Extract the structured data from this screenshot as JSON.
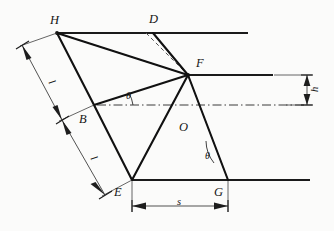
{
  "figure": {
    "type": "geometry-diagram",
    "background_color": "#fbfbfa",
    "line_color": "#1a1a1a",
    "dash_color": "#4d4d4d",
    "dim_color": "#2b2b2b"
  },
  "points": [
    {
      "id": "H",
      "label": "H",
      "x": 57,
      "y": 33,
      "label_x": 50,
      "label_y": 14
    },
    {
      "id": "D",
      "label": "D",
      "x": 153,
      "y": 33,
      "label_x": 149,
      "label_y": 13
    },
    {
      "id": "F",
      "label": "F",
      "x": 188,
      "y": 75,
      "label_x": 196,
      "label_y": 57
    },
    {
      "id": "B",
      "label": "B",
      "x": 94,
      "y": 105,
      "label_x": 79,
      "label_y": 113
    },
    {
      "id": "O",
      "label": "O",
      "x": 176,
      "y": 122,
      "label_x": 179,
      "label_y": 121
    },
    {
      "id": "E",
      "label": "E",
      "x": 132,
      "y": 180,
      "label_x": 114,
      "label_y": 186
    },
    {
      "id": "G",
      "label": "G",
      "x": 228,
      "y": 180,
      "label_x": 214,
      "label_y": 186
    }
  ],
  "dimension_labels": [
    {
      "id": "l-upper",
      "text": "l",
      "x": 50,
      "y": 77
    },
    {
      "id": "l-lower",
      "text": "l",
      "x": 92,
      "y": 153
    },
    {
      "id": "s-stroke",
      "text": "s",
      "x": 177,
      "y": 198
    },
    {
      "id": "h-height",
      "text": "h",
      "x": 313,
      "y": 84
    }
  ],
  "angle_labels": [
    {
      "id": "theta-upper",
      "text": "θ",
      "x": 126,
      "y": 92
    },
    {
      "id": "theta-lower",
      "text": "θ",
      "x": 206,
      "y": 152
    }
  ],
  "horizontal_lines": [
    {
      "id": "top-line",
      "x1": 57,
      "y1": 33,
      "x2": 248,
      "y2": 33
    },
    {
      "id": "middle-line",
      "x1": 188,
      "y1": 75,
      "x2": 273,
      "y2": 75
    },
    {
      "id": "bottom-line",
      "x1": 132,
      "y1": 180,
      "x2": 310,
      "y2": 180
    }
  ],
  "solid_links": [
    {
      "id": "H-F",
      "x1": 57,
      "y1": 33,
      "x2": 188,
      "y2": 75
    },
    {
      "id": "H-B",
      "x1": 57,
      "y1": 33,
      "x2": 94,
      "y2": 105
    },
    {
      "id": "B-F",
      "x1": 94,
      "y1": 105,
      "x2": 188,
      "y2": 75
    },
    {
      "id": "B-E",
      "x1": 94,
      "y1": 105,
      "x2": 132,
      "y2": 180
    },
    {
      "id": "D-F",
      "x1": 153,
      "y1": 33,
      "x2": 188,
      "y2": 75
    },
    {
      "id": "F-E",
      "x1": 188,
      "y1": 75,
      "x2": 132,
      "y2": 180
    },
    {
      "id": "F-G",
      "x1": 188,
      "y1": 75,
      "x2": 228,
      "y2": 180
    }
  ],
  "dashed_links": [
    {
      "id": "H-F-dashed",
      "x1": 57,
      "y1": 33,
      "x2": 188,
      "y2": 75
    },
    {
      "id": "D-F-dashed",
      "x1": 147,
      "y1": 33,
      "x2": 188,
      "y2": 75
    },
    {
      "id": "F-E-dashed",
      "x1": 188,
      "y1": 75,
      "x2": 132,
      "y2": 180
    },
    {
      "id": "F-G-dashed",
      "x1": 188,
      "y1": 75,
      "x2": 228,
      "y2": 180
    }
  ],
  "centerline": {
    "id": "axis-dash-dot",
    "x1": 97,
    "y1": 105,
    "x2": 307,
    "y2": 105
  },
  "dimension_lines": [
    {
      "id": "dim-l-upper",
      "x1": 22,
      "y1": 45,
      "x2": 62,
      "y2": 120
    },
    {
      "id": "dim-l-lower",
      "x1": 62,
      "y1": 120,
      "x2": 105,
      "y2": 195
    },
    {
      "id": "dim-s",
      "x1": 132,
      "y1": 206,
      "x2": 228,
      "y2": 206
    },
    {
      "id": "dim-h",
      "x1": 307,
      "y1": 75,
      "x2": 307,
      "y2": 105
    }
  ],
  "extension_lines": [
    {
      "id": "ext-H",
      "x1": 57,
      "y1": 33,
      "x2": 22,
      "y2": 45
    },
    {
      "id": "ext-B",
      "x1": 94,
      "y1": 105,
      "x2": 62,
      "y2": 120
    },
    {
      "id": "ext-E",
      "x1": 132,
      "y1": 180,
      "x2": 105,
      "y2": 195
    },
    {
      "id": "ext-Ev",
      "x1": 132,
      "y1": 180,
      "x2": 132,
      "y2": 210
    },
    {
      "id": "ext-Gv",
      "x1": 228,
      "y1": 180,
      "x2": 228,
      "y2": 210
    },
    {
      "id": "ext-Fh",
      "x1": 273,
      "y1": 75,
      "x2": 311,
      "y2": 75
    },
    {
      "id": "ext-Ch",
      "x1": 285,
      "y1": 105,
      "x2": 311,
      "y2": 105
    }
  ]
}
